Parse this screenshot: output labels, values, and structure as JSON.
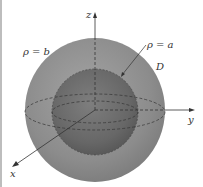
{
  "figure": {
    "labels": {
      "outer_sphere": "ρ = b",
      "inner_sphere": "ρ = a",
      "region": "D",
      "x_axis": "x",
      "y_axis": "y",
      "z_axis": "z"
    },
    "colors": {
      "outer_sphere": "#8a8a8a",
      "inner_sphere": "#6e6e6e",
      "axis": "#333333",
      "background": "#ffffff"
    }
  }
}
